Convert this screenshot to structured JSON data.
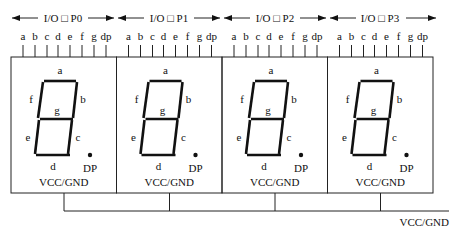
{
  "diagram": {
    "type": "4-digit 7-segment LED display wiring",
    "colors": {
      "line": "#222222",
      "text": "#111111",
      "background": "#ffffff"
    },
    "ports": [
      {
        "label": "I/O □ P0"
      },
      {
        "label": "I/O □ P1"
      },
      {
        "label": "I/O □ P2"
      },
      {
        "label": "I/O □ P3"
      }
    ],
    "pin_labels": [
      "a",
      "b",
      "c",
      "d",
      "e",
      "f",
      "g",
      "dp"
    ],
    "segment_labels": {
      "a": "a",
      "b": "b",
      "c": "c",
      "d": "d",
      "e": "e",
      "f": "f",
      "g": "g",
      "dp": "DP"
    },
    "digits": [
      {
        "common_label": "VCC/GND"
      },
      {
        "common_label": "VCC/GND"
      },
      {
        "common_label": "VCC/GND"
      },
      {
        "common_label": "VCC/GND"
      }
    ],
    "bus_label": "VCC/GND"
  }
}
